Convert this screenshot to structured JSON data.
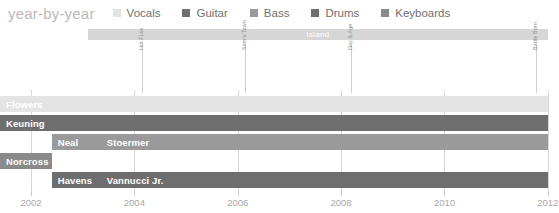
{
  "title": "year-by-year",
  "legend": {
    "position": "top",
    "items": [
      {
        "label": "Vocals",
        "color": "#e4e4e4"
      },
      {
        "label": "Guitar",
        "color": "#6e6e6e"
      },
      {
        "label": "Bass",
        "color": "#9a9a9a"
      },
      {
        "label": "Drums",
        "color": "#6e6e6e"
      },
      {
        "label": "Keyboards",
        "color": "#8a8a8a"
      }
    ]
  },
  "label_band": {
    "text": "Island",
    "color": "#d6d6d6",
    "start": 2003.1,
    "end": 2012.0
  },
  "markers": [
    {
      "label": "Hot Fuss",
      "year": 2004.15
    },
    {
      "label": "Sam's Town",
      "year": 2006.15
    },
    {
      "label": "Day & Age",
      "year": 2008.2
    },
    {
      "label": "Battle Born",
      "year": 2011.78
    }
  ],
  "chart_data": {
    "type": "bar",
    "orientation": "horizontal",
    "title": "year-by-year",
    "xlabel": "",
    "ylabel": "",
    "xlim": [
      2001.4,
      2012.1
    ],
    "ticks": [
      2002,
      2004,
      2006,
      2008,
      2010,
      2012
    ],
    "tick_labels": [
      "2002",
      "2004",
      "2006",
      "2008",
      "2010",
      "2012"
    ],
    "grid": true,
    "series": [
      {
        "name": "Vocals",
        "color": "#e4e4e4",
        "row": 0,
        "segments": [
          {
            "label": "Flowers",
            "start": 2001.4,
            "end": 2012.0
          }
        ]
      },
      {
        "name": "Guitar",
        "color": "#6e6e6e",
        "row": 1,
        "segments": [
          {
            "label": "Keuning",
            "start": 2001.4,
            "end": 2012.0
          }
        ]
      },
      {
        "name": "Bass",
        "color": "#9a9a9a",
        "row": 2,
        "segments": [
          {
            "label": "Neal",
            "start": 2002.4,
            "end": 2003.35
          },
          {
            "label": "Stoermer",
            "start": 2003.35,
            "end": 2012.0
          }
        ]
      },
      {
        "name": "Keyboards",
        "color": "#8a8a8a",
        "row": 3,
        "segments": [
          {
            "label": "Norcross",
            "start": 2001.4,
            "end": 2002.4
          }
        ]
      },
      {
        "name": "Drums",
        "color": "#6e6e6e",
        "row": 4,
        "segments": [
          {
            "label": "Havens",
            "start": 2002.4,
            "end": 2003.35
          },
          {
            "label": "Vannucci Jr.",
            "start": 2003.35,
            "end": 2012.0
          }
        ]
      }
    ]
  }
}
